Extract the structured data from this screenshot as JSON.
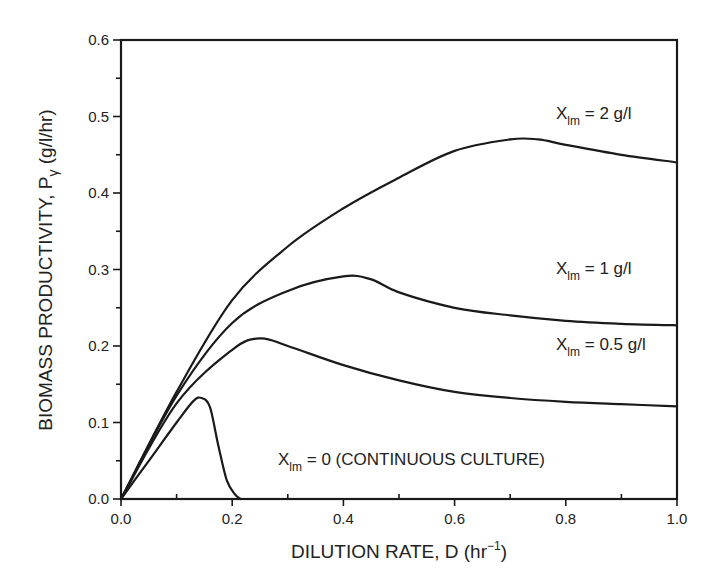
{
  "chart_data": {
    "type": "line",
    "title": "",
    "xlabel": "DILUTION RATE, D (hr⁻¹)",
    "xlabel_parts": {
      "main": "DILUTION RATE, D (hr",
      "sup": "−1",
      "close": ")"
    },
    "ylabel": "BIOMASS PRODUCTIVITY, Pγ (g/l/hr)",
    "ylabel_parts": {
      "main": "BIOMASS PRODUCTIVITY, P",
      "sub": "γ",
      "rest": " (g/l/hr)"
    },
    "xlim": [
      0.0,
      1.0
    ],
    "ylim": [
      0.0,
      0.6
    ],
    "x_ticks": [
      "0.0",
      "0.2",
      "0.4",
      "0.6",
      "0.8",
      "1.0"
    ],
    "y_ticks": [
      "0.0",
      "0.1",
      "0.2",
      "0.3",
      "0.4",
      "0.5",
      "0.6"
    ],
    "grid": false,
    "legend": "inline annotations",
    "series": [
      {
        "name": "X_lm = 2 g/l",
        "label": {
          "main": "X",
          "sub": "lm",
          "rest": " = 2 g/l"
        },
        "x": [
          0,
          0.1,
          0.2,
          0.3,
          0.4,
          0.5,
          0.6,
          0.7,
          0.75,
          0.8,
          0.9,
          1.0
        ],
        "y": [
          0,
          0.14,
          0.26,
          0.33,
          0.38,
          0.42,
          0.455,
          0.47,
          0.47,
          0.463,
          0.45,
          0.44
        ]
      },
      {
        "name": "X_lm = 1 g/l",
        "label": {
          "main": "X",
          "sub": "lm",
          "rest": " = 1 g/l"
        },
        "x": [
          0,
          0.1,
          0.2,
          0.3,
          0.4,
          0.45,
          0.5,
          0.6,
          0.7,
          0.8,
          0.9,
          1.0
        ],
        "y": [
          0,
          0.135,
          0.23,
          0.272,
          0.291,
          0.287,
          0.27,
          0.25,
          0.24,
          0.233,
          0.229,
          0.227
        ]
      },
      {
        "name": "X_lm = 0.5 g/l",
        "label": {
          "main": "X",
          "sub": "lm",
          "rest": " = 0.5 g/l"
        },
        "x": [
          0,
          0.1,
          0.2,
          0.25,
          0.3,
          0.4,
          0.5,
          0.6,
          0.7,
          0.8,
          0.9,
          1.0
        ],
        "y": [
          0,
          0.125,
          0.195,
          0.21,
          0.2,
          0.175,
          0.155,
          0.14,
          0.132,
          0.127,
          0.124,
          0.121
        ]
      },
      {
        "name": "X_lm = 0 (CONTINUOUS CULTURE)",
        "label": {
          "main": "X",
          "sub": "lm",
          "rest": " = 0  (CONTINUOUS CULTURE)"
        },
        "x": [
          0,
          0.05,
          0.1,
          0.13,
          0.145,
          0.16,
          0.175,
          0.19,
          0.205,
          0.215
        ],
        "y": [
          0,
          0.05,
          0.1,
          0.128,
          0.132,
          0.12,
          0.07,
          0.025,
          0.006,
          0
        ]
      }
    ]
  },
  "layout": {
    "plot": {
      "left": 121,
      "top": 40,
      "right": 677,
      "bottom": 499
    },
    "annotations": [
      {
        "series": 0,
        "x": 556,
        "y": 119
      },
      {
        "series": 1,
        "x": 556,
        "y": 274
      },
      {
        "series": 2,
        "x": 556,
        "y": 350
      },
      {
        "series": 3,
        "x": 278,
        "y": 465
      }
    ]
  }
}
